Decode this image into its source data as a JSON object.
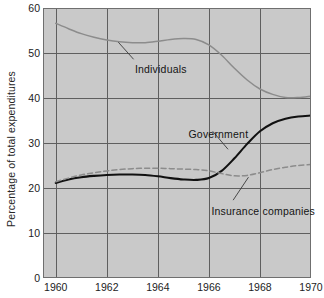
{
  "chart_data": {
    "type": "line",
    "title": "",
    "xlabel": "",
    "ylabel": "Percentage of total expenditures",
    "xlim": [
      1959.5,
      1970.0
    ],
    "ylim": [
      0,
      60
    ],
    "xticks": [
      1960,
      1962,
      1964,
      1966,
      1968,
      1970
    ],
    "xtick_labels": [
      "1960",
      "1962",
      "1964",
      "1966",
      "1968",
      "1970"
    ],
    "yticks": [
      0,
      10,
      20,
      30,
      40,
      50,
      60
    ],
    "ytick_labels": [
      "0",
      "10",
      "20",
      "30",
      "40",
      "50",
      "60"
    ],
    "grid": true,
    "grid_x": true,
    "grid_y": true,
    "legend_position": "inline-annotations",
    "plot_background": "#c9c9c9",
    "series": [
      {
        "name": "Individuals",
        "style": "solid-gray",
        "color": "#8c8c8c",
        "x": [
          1960,
          1960.5,
          1961,
          1961.5,
          1962,
          1962.5,
          1963,
          1963.5,
          1964,
          1964.5,
          1965,
          1965.5,
          1966,
          1966.5,
          1967,
          1967.5,
          1968,
          1968.5,
          1969,
          1969.5,
          1970
        ],
        "values": [
          56.6,
          55.4,
          54.3,
          53.5,
          52.9,
          52.5,
          52.3,
          52.3,
          52.6,
          53.0,
          53.2,
          53.0,
          51.8,
          49.5,
          46.6,
          44.0,
          42.0,
          40.8,
          40.1,
          40.1,
          40.4
        ]
      },
      {
        "name": "Government",
        "style": "solid-black",
        "color": "#111111",
        "x": [
          1960,
          1960.5,
          1961,
          1961.5,
          1962,
          1962.5,
          1963,
          1963.5,
          1964,
          1964.5,
          1965,
          1965.5,
          1966,
          1966.5,
          1967,
          1967.5,
          1968,
          1968.5,
          1969,
          1969.5,
          1970
        ],
        "values": [
          21.1,
          21.9,
          22.4,
          22.7,
          22.9,
          23.0,
          23.0,
          22.9,
          22.6,
          22.2,
          21.9,
          21.8,
          22.2,
          23.8,
          26.6,
          29.8,
          32.6,
          34.4,
          35.4,
          35.9,
          36.1
        ]
      },
      {
        "name": "Insurance companies",
        "style": "dashed-gray",
        "color": "#8c8c8c",
        "x": [
          1960,
          1960.5,
          1961,
          1961.5,
          1962,
          1962.5,
          1963,
          1963.5,
          1964,
          1964.5,
          1965,
          1965.5,
          1966,
          1966.5,
          1967,
          1967.5,
          1968,
          1968.5,
          1969,
          1969.5,
          1970
        ],
        "values": [
          21.4,
          22.2,
          22.9,
          23.4,
          23.8,
          24.1,
          24.3,
          24.4,
          24.4,
          24.3,
          24.2,
          24.1,
          23.8,
          23.2,
          22.7,
          22.8,
          23.4,
          24.1,
          24.6,
          25.0,
          25.2
        ]
      }
    ],
    "annotations": [
      {
        "text": "Individuals",
        "x": 1963.1,
        "y": 46.5
      },
      {
        "text": "Government",
        "x": 1965.2,
        "y": 32.0
      },
      {
        "text": "Insurance companies",
        "x": 1966.1,
        "y": 14.9
      }
    ]
  }
}
